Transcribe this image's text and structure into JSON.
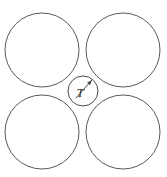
{
  "figure": {
    "canvas": {
      "width": 167,
      "height": 177,
      "background_color": "#ffffff"
    },
    "style": {
      "stroke_color": "#595959",
      "small_circle_stroke_color": "#4a4a4a",
      "label_color": "#2e2e2e",
      "stroke_width": 1
    },
    "labels": {
      "center_circle_radius_label": "T"
    },
    "large_circles": [
      {
        "name": "top-left",
        "cx": 42,
        "cy": 50,
        "r": 37
      },
      {
        "name": "top-right",
        "cx": 123,
        "cy": 50,
        "r": 37
      },
      {
        "name": "bottom-left",
        "cx": 42,
        "cy": 132,
        "r": 37
      },
      {
        "name": "bottom-right",
        "cx": 123,
        "cy": 132,
        "r": 37
      }
    ],
    "small_circle": {
      "name": "center-inscribed-circle",
      "cx": 83,
      "cy": 91,
      "r": 15
    },
    "radius_leader": {
      "from_x": 76,
      "from_y": 98,
      "to_x": 92,
      "to_y": 80
    },
    "label_position": {
      "x": 80,
      "y": 97
    }
  }
}
